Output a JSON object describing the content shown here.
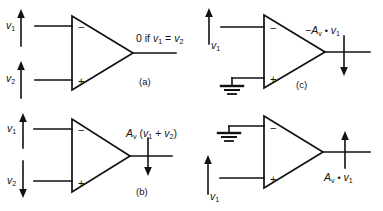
{
  "figure": {
    "background_color": "#ffffff",
    "line_color": "#111111",
    "width": 383,
    "height": 211
  },
  "panels": [
    {
      "id": "a",
      "caption": "(a)",
      "inputs": [
        {
          "name": "v1-input-label",
          "label": "v",
          "sub": "1",
          "terminal": "minus",
          "arrow": "up"
        },
        {
          "name": "v2-input-label",
          "label": "v",
          "sub": "2",
          "terminal": "plus",
          "arrow": "up"
        }
      ],
      "terminal_minus": "−",
      "terminal_plus": "+",
      "output": {
        "text_prefix": "0 if ",
        "var1": "v",
        "var1_sub": "1",
        "equals": " = ",
        "var2": "v",
        "var2_sub": "2",
        "arrow": "none"
      },
      "ground": false
    },
    {
      "id": "b",
      "caption": "(b)",
      "inputs": [
        {
          "name": "v1-input-label",
          "label": "v",
          "sub": "1",
          "terminal": "minus",
          "arrow": "up"
        },
        {
          "name": "v2-input-label",
          "label": "v",
          "sub": "2",
          "terminal": "plus",
          "arrow": "down"
        }
      ],
      "terminal_minus": "−",
      "terminal_plus": "+",
      "output": {
        "gain": "A",
        "gain_sub": "v",
        "expr_open": " (",
        "var1": "v",
        "var1_sub": "1",
        "operator": " + ",
        "var2": "v",
        "var2_sub": "2",
        "expr_close": ")",
        "arrow": "down"
      },
      "ground": false
    },
    {
      "id": "c",
      "caption": "(c)",
      "inputs": [
        {
          "name": "v1-input-label",
          "label": "v",
          "sub": "1",
          "terminal": "minus",
          "arrow": "up"
        }
      ],
      "terminal_minus": "−",
      "terminal_plus": "+",
      "output": {
        "sign": "−",
        "gain": "A",
        "gain_sub": "v",
        "dot": "•",
        "var1": "v",
        "var1_sub": "1",
        "arrow": "down"
      },
      "ground": true,
      "ground_terminal": "plus"
    },
    {
      "id": "d",
      "caption": "",
      "inputs": [
        {
          "name": "v1-input-label",
          "label": "v",
          "sub": "1",
          "terminal": "plus",
          "arrow": "up"
        }
      ],
      "terminal_minus": "−",
      "terminal_plus": "+",
      "output": {
        "gain": "A",
        "gain_sub": "v",
        "dot": "•",
        "var1": "v",
        "var1_sub": "1",
        "arrow": "up"
      },
      "ground": true,
      "ground_terminal": "minus"
    }
  ]
}
